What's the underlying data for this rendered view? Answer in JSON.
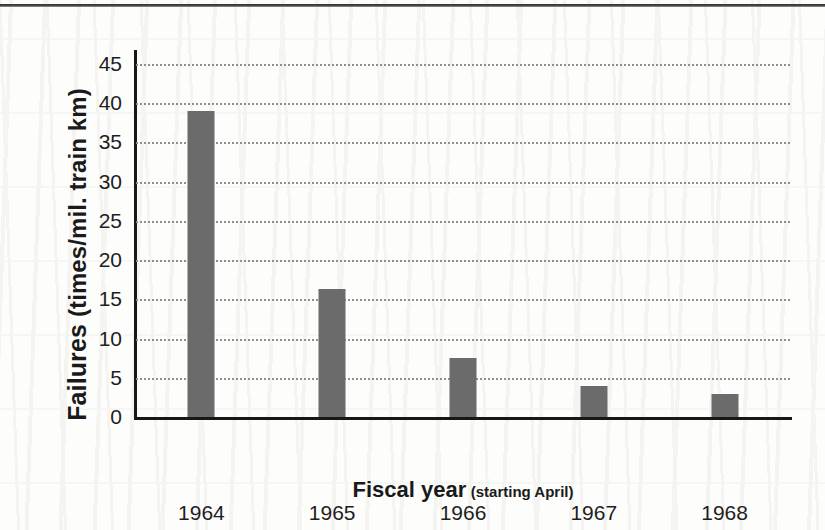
{
  "chart_data": {
    "type": "bar",
    "title": "",
    "categories": [
      "1964",
      "1965",
      "1966",
      "1967",
      "1968"
    ],
    "values": [
      39.0,
      16.3,
      7.5,
      4.0,
      2.9
    ],
    "xlabel": "Fiscal year (starting April)",
    "ylabel": "Failures  (times/mil. train km)",
    "ylim": [
      0,
      45
    ],
    "yticks": [
      0,
      5,
      10,
      15,
      20,
      25,
      30,
      35,
      40,
      45
    ],
    "ytick_labels": [
      "0",
      "5",
      "10",
      "15",
      "20",
      "25",
      "30",
      "35",
      "40",
      "45"
    ],
    "grid": true,
    "grid_style": "dotted-horizontal",
    "legend": false,
    "series": [
      {
        "name": "Failures",
        "values": [
          39.0,
          16.3,
          7.5,
          4.0,
          2.9
        ]
      }
    ]
  },
  "axes": {
    "y_title_main": "Failures",
    "y_title_unit": "(times/mil. train km)",
    "x_title_main": "Fiscal year",
    "x_title_sub": "(starting April)"
  },
  "colors": {
    "bar": "#6b6b6b",
    "axis": "#181818",
    "gridline": "#8e8e8e",
    "background": "#fdfdfb",
    "text": "#1a1a1a"
  }
}
